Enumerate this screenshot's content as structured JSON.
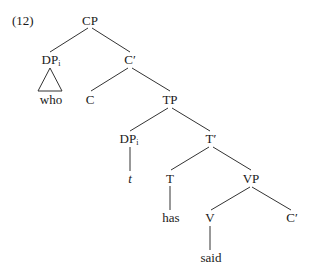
{
  "example_number": "(12)",
  "tree": {
    "nodes": {
      "cp": {
        "label": "CP"
      },
      "dp_i_top": {
        "label": "DP",
        "subscript": "i"
      },
      "c_bar_top": {
        "label": "C′"
      },
      "who": {
        "label": "who"
      },
      "c": {
        "label": "C"
      },
      "tp": {
        "label": "TP"
      },
      "dp_i_low": {
        "label": "DP",
        "subscript": "i"
      },
      "t_bar": {
        "label": "T′"
      },
      "trace": {
        "label": "t"
      },
      "t": {
        "label": "T"
      },
      "vp": {
        "label": "VP"
      },
      "has": {
        "label": "has"
      },
      "v": {
        "label": "V"
      },
      "c_bar_low": {
        "label": "C′"
      },
      "said": {
        "label": "said"
      }
    },
    "edges": [
      [
        "cp",
        "dp_i_top"
      ],
      [
        "cp",
        "c_bar_top"
      ],
      [
        "dp_i_top",
        "who",
        "triangle"
      ],
      [
        "c_bar_top",
        "c"
      ],
      [
        "c_bar_top",
        "tp"
      ],
      [
        "tp",
        "dp_i_low"
      ],
      [
        "tp",
        "t_bar"
      ],
      [
        "dp_i_low",
        "trace"
      ],
      [
        "t_bar",
        "t"
      ],
      [
        "t_bar",
        "vp"
      ],
      [
        "t",
        "has"
      ],
      [
        "vp",
        "v"
      ],
      [
        "vp",
        "c_bar_low"
      ],
      [
        "v",
        "said"
      ]
    ]
  },
  "colors": {
    "line": "#333333",
    "text": "#1a1a1a",
    "background": "#ffffff"
  }
}
